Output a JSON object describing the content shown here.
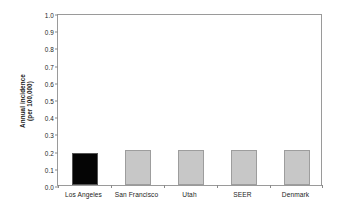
{
  "chart_data": {
    "type": "bar",
    "title": "",
    "xlabel": "",
    "ylabel": "Annual incidence (per 100,000)",
    "ylabel_lines": [
      "Annual incidence",
      "(per 100,000)"
    ],
    "categories": [
      "Los Angeles",
      "San Francisco",
      "Utah",
      "SEER",
      "Denmark"
    ],
    "values": [
      0.185,
      0.205,
      0.205,
      0.205,
      0.205
    ],
    "ylim": [
      0.0,
      1.0
    ],
    "ytick_labels": [
      "1.0",
      "0.9",
      "0.8",
      "0.7",
      "0.6",
      "0.5",
      "0.4",
      "0.3",
      "0.2",
      "0.1",
      "0.0"
    ],
    "ytick_values": [
      1.0,
      0.9,
      0.8,
      0.7,
      0.6,
      0.5,
      0.4,
      0.3,
      0.2,
      0.1,
      0.0
    ],
    "grid": false,
    "legend": null,
    "bar_colors": [
      "#050505",
      "#c7c7c7",
      "#c7c7c7",
      "#c7c7c7",
      "#c7c7c7"
    ],
    "highlight_category": "Los Angeles",
    "frame_color": "#9a9a9a",
    "background": "#ffffff"
  }
}
